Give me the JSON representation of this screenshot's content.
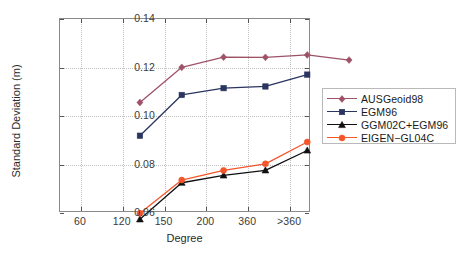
{
  "chart_data": {
    "type": "line",
    "title": "",
    "xlabel": "Degree",
    "ylabel": "Standard Deviation (m)",
    "categories": [
      "60",
      "120",
      "150",
      "200",
      "360",
      ">360"
    ],
    "xtick_labels": [
      "60",
      "120",
      "150",
      "200",
      "360",
      ">360"
    ],
    "ytick_labels": [
      "0.06",
      "0.08",
      "0.10",
      "0.12",
      "0.14"
    ],
    "ytick_values": [
      0.06,
      0.08,
      0.1,
      0.12,
      0.14
    ],
    "ylim": [
      0.06,
      0.14
    ],
    "grid": true,
    "grid_style": "dotted",
    "legend_position": "right-outside",
    "series": [
      {
        "name": "AUSGeoid98",
        "color": "#9e5268",
        "marker": "diamond",
        "values": [
          0.113,
          0.1275,
          0.1317,
          0.1316,
          0.1326,
          0.1305
        ]
      },
      {
        "name": "EGM96",
        "color": "#2a3560",
        "marker": "square",
        "values": [
          0.0993,
          0.1161,
          0.1189,
          0.1196,
          0.1245,
          null
        ]
      },
      {
        "name": "GGM02C+EGM96",
        "color": "#101010",
        "marker": "triangle",
        "values": [
          0.0648,
          0.0799,
          0.0829,
          0.085,
          0.0932,
          null
        ]
      },
      {
        "name": "EIGEN-GL04C",
        "color": "#f4562a",
        "marker": "circle",
        "values": [
          0.0673,
          0.081,
          0.085,
          0.0877,
          0.0967,
          null
        ]
      }
    ]
  },
  "legend": {
    "entries": [
      {
        "label": "AUSGeoid98"
      },
      {
        "label": "EGM96"
      },
      {
        "label": "GGM02C+EGM96"
      },
      {
        "label": "EIGEN−GL04C"
      }
    ]
  },
  "axes": {
    "x_title": "Degree",
    "y_title": "Standard Deviation (m)"
  }
}
